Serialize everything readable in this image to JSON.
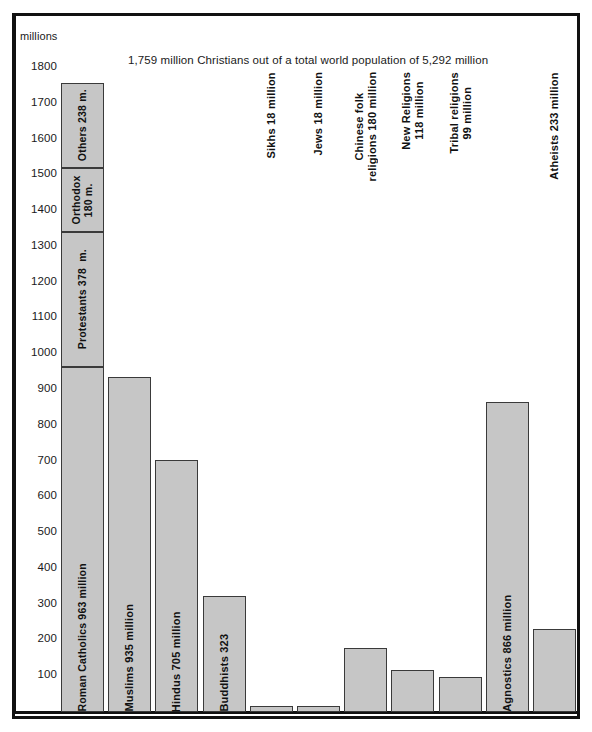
{
  "units_label": "millions",
  "chart_data": {
    "type": "bar",
    "title": "1,759 million Christians out of a total world population of 5,292 million",
    "xlabel": "",
    "ylabel": "millions",
    "ylim": [
      0,
      1800
    ],
    "yticks": [
      1800,
      1700,
      1600,
      1500,
      1400,
      1300,
      1200,
      1100,
      1000,
      900,
      800,
      700,
      600,
      500,
      400,
      300,
      200,
      100
    ],
    "grid": false,
    "legend": "none",
    "categories": [
      "Christians",
      "Muslims",
      "Hindus",
      "Buddhists",
      "Sikhs",
      "Jews",
      "Chinese folk religions",
      "New Religions",
      "Tribal religions",
      "Agnostics",
      "Atheists"
    ],
    "values": [
      1759,
      935,
      705,
      323,
      18,
      18,
      180,
      118,
      99,
      866,
      233
    ],
    "stacked_first_bar": {
      "total": 1759,
      "segments": [
        {
          "name": "Roman Catholics",
          "value": 963,
          "label": "Roman Catholics 963 million"
        },
        {
          "name": "Protestants",
          "value": 378,
          "label": "Protestants 378  m."
        },
        {
          "name": "Orthodox",
          "value": 180,
          "label": "Orthodox\n180 m."
        },
        {
          "name": "Others",
          "value": 238,
          "label": "Others 238 m."
        }
      ]
    },
    "bars": [
      {
        "name": "christians",
        "value": 1759,
        "label": "",
        "label_position": "inside",
        "stacked": true
      },
      {
        "name": "muslims",
        "value": 935,
        "label": "Muslims 935 million",
        "label_position": "inside",
        "stacked": false
      },
      {
        "name": "hindus",
        "value": 705,
        "label": "Hindus 705 million",
        "label_position": "inside",
        "stacked": false
      },
      {
        "name": "buddhists",
        "value": 323,
        "label": "Buddhists 323",
        "label_position": "inside",
        "stacked": false
      },
      {
        "name": "sikhs",
        "value": 18,
        "label": "Sikhs 18 million",
        "label_position": "outside",
        "stacked": false
      },
      {
        "name": "jews",
        "value": 18,
        "label": "Jews 18 million",
        "label_position": "outside",
        "stacked": false
      },
      {
        "name": "chinese-folk-religions",
        "value": 180,
        "label": "Chinese folk\nreligions 180 million",
        "label_position": "outside",
        "stacked": false
      },
      {
        "name": "new-religions",
        "value": 118,
        "label": "New Religions\n118 million",
        "label_position": "outside",
        "stacked": false
      },
      {
        "name": "tribal-religions",
        "value": 99,
        "label": "Tribal religions\n99 million",
        "label_position": "outside",
        "stacked": false
      },
      {
        "name": "agnostics",
        "value": 866,
        "label": "Agnostics 866 million",
        "label_position": "inside",
        "stacked": false
      },
      {
        "name": "atheists",
        "value": 233,
        "label": "Atheists 233 million",
        "label_position": "outside",
        "stacked": false
      }
    ],
    "colors": {
      "bar_fill": "#c6c6c6",
      "bar_stroke": "#3a3a3a",
      "axis": "#111111",
      "text": "#1a1a1a",
      "background": "#ffffff"
    }
  }
}
